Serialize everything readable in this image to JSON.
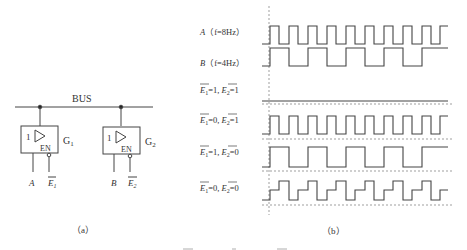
{
  "figure": {
    "part_a": {
      "caption": "（a）",
      "bus_label": "BUS",
      "gates": [
        {
          "name": "G1",
          "name_main": "G",
          "name_sub": "1",
          "symbol": "1",
          "enable_label": "EN",
          "input_label": "A",
          "enable_input_label": "E",
          "enable_input_sub": "1"
        },
        {
          "name": "G2",
          "name_main": "G",
          "name_sub": "2",
          "symbol": "1",
          "enable_label": "EN",
          "input_label": "B",
          "enable_input_label": "E",
          "enable_input_sub": "2"
        }
      ]
    },
    "part_b": {
      "caption": "（b）",
      "rows": [
        {
          "label_pre": "A",
          "label_post": "（f=8Hz）",
          "signal": "A"
        },
        {
          "label_pre": "B",
          "label_post": "（f=4Hz）",
          "signal": "B"
        },
        {
          "e1": "1",
          "e2": "1",
          "signal": "high-Z"
        },
        {
          "e1": "0",
          "e2": "1",
          "signal": "A"
        },
        {
          "e1": "1",
          "e2": "0",
          "signal": "B"
        },
        {
          "e1": "0",
          "e2": "0",
          "signal": "A+B conflict"
        }
      ]
    },
    "bottom_caption_partial": "图 ... （a） ... 图"
  },
  "colors": {
    "line": "#444444",
    "dashed": "#666666",
    "text": "#333333"
  }
}
